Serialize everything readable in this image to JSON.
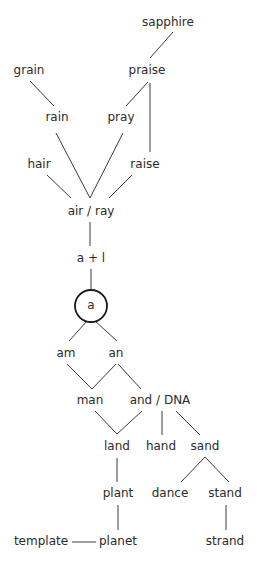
{
  "diagram": {
    "nodes": {
      "sapphire": "sapphire",
      "grain": "grain",
      "praise": "praise",
      "rain": "rain",
      "pray": "pray",
      "hair": "hair",
      "raise": "raise",
      "air_ray": "air / ray",
      "a_plus_l": "a + l",
      "root_a": "a",
      "am": "am",
      "an": "an",
      "man": "man",
      "and_dna": "and / DNA",
      "land": "land",
      "hand": "hand",
      "sand": "sand",
      "plant": "plant",
      "dance": "dance",
      "stand": "stand",
      "template": "template",
      "planet": "planet",
      "strand": "strand"
    }
  }
}
